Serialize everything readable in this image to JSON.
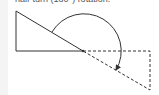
{
  "caption": {
    "text": "half-turn (180°) rotation."
  },
  "figure": {
    "colors": {
      "stroke": "#333333",
      "background": "#ffffff"
    },
    "original_triangle": {
      "points": [
        [
          16,
          11
        ],
        [
          16,
          51
        ],
        [
          83,
          51
        ]
      ],
      "style": "solid"
    },
    "rotated_triangle": {
      "points": [
        [
          150,
          90
        ],
        [
          150,
          51
        ],
        [
          83,
          51
        ]
      ],
      "style": "dashed"
    },
    "pivot": [
      83,
      51
    ],
    "rotation_arrow": {
      "center": [
        83,
        51
      ],
      "radius": 37,
      "angle_deg": 180,
      "direction": "clockwise"
    }
  }
}
